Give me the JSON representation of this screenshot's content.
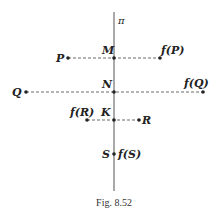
{
  "figure": {
    "caption": "Fig. 8.52",
    "plane_label": "π",
    "line_color": "#555555",
    "dash_color": "#444444"
  },
  "points": {
    "P": {
      "label": "P",
      "x": 68,
      "y": 58
    },
    "fP": {
      "label": "f(P)",
      "x": 160,
      "y": 58
    },
    "M": {
      "label": "M",
      "x": 114,
      "y": 58
    },
    "Q": {
      "label": "Q",
      "x": 26,
      "y": 92
    },
    "fQ": {
      "label": "f(Q)",
      "x": 203,
      "y": 92
    },
    "N": {
      "label": "N",
      "x": 114,
      "y": 92
    },
    "R": {
      "label": "R",
      "x": 139,
      "y": 120
    },
    "fR": {
      "label": "f(R)",
      "x": 87,
      "y": 120
    },
    "K": {
      "label": "K",
      "x": 114,
      "y": 120
    },
    "S": {
      "label": "S",
      "x": 114,
      "y": 154
    },
    "fS": {
      "label": "f(S)",
      "x": 114,
      "y": 154
    }
  }
}
